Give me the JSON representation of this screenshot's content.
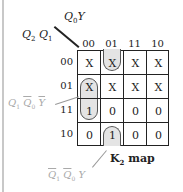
{
  "diagram": {
    "title": "K2 map",
    "title_main": "K",
    "title_sub": "2",
    "title_suffix": " map",
    "col_variable": {
      "a": "Q",
      "a_sub": "0",
      "b": "Y"
    },
    "row_variable": {
      "a": "Q",
      "a_sub": "2",
      "b": "Q",
      "b_sub": "1"
    },
    "col_headers": [
      "00",
      "01",
      "11",
      "10"
    ],
    "row_headers": [
      "00",
      "01",
      "11",
      "10"
    ],
    "cells": [
      [
        "X",
        "X",
        "X",
        "X"
      ],
      [
        "X",
        "X",
        "X",
        "X"
      ],
      [
        "1",
        "0",
        "0",
        "0"
      ],
      [
        "0",
        "1",
        "0",
        "0"
      ]
    ],
    "groupings": [
      {
        "term": "Q1 Q0' Y'",
        "cells": [
          [
            1,
            0
          ],
          [
            2,
            0
          ]
        ]
      },
      {
        "term": "Q1' Q0' Y",
        "cells": [
          [
            3,
            1
          ],
          [
            0,
            1
          ]
        ],
        "wraps": true
      }
    ],
    "annotations": {
      "group1": {
        "q1": "Q",
        "q1_sub": "1",
        "q0": "Q",
        "q0_sub": "0",
        "y": "Y"
      },
      "group2": {
        "q1": "Q",
        "q1_sub": "1",
        "q0": "Q",
        "q0_sub": "0",
        "y": "Y"
      }
    },
    "colors": {
      "loop_fill": "#e4e4e4",
      "grid": "#222222",
      "annotation": "#aaaaaa"
    }
  }
}
